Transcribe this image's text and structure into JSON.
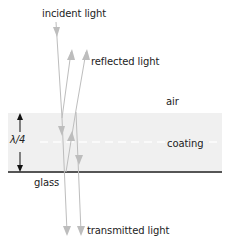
{
  "diagram": {
    "type": "anti-reflection coating ray diagram",
    "labels": {
      "incident": "incident light",
      "reflected": "reflected light",
      "air": "air",
      "coating": "coating",
      "glass": "glass",
      "transmitted": "transmitted light",
      "thickness": "λ/4"
    },
    "layers": [
      {
        "name": "air",
        "color": "#ffffff"
      },
      {
        "name": "coating",
        "color": "#f0f0f0"
      },
      {
        "name": "glass",
        "color": "#ffffff"
      }
    ],
    "colors": {
      "ray": "#bdbdbd",
      "glass_line": "#555555",
      "text": "#222222",
      "dimension_arrow": "#111111"
    },
    "rays": [
      {
        "name": "incident",
        "direction": "down"
      },
      {
        "name": "reflected-1",
        "direction": "up"
      },
      {
        "name": "reflected-2",
        "direction": "up"
      },
      {
        "name": "transmitted-1",
        "direction": "down"
      },
      {
        "name": "transmitted-2",
        "direction": "down"
      }
    ]
  }
}
